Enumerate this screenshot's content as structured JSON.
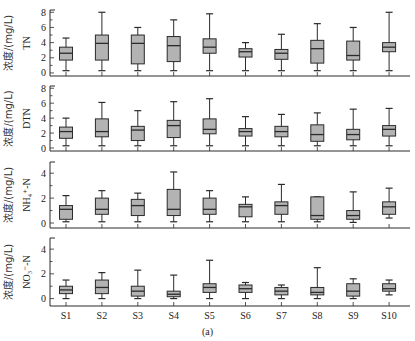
{
  "figure": {
    "caption": "(a)",
    "shared_ylabel_prefix": "浓度/(mg/L)"
  },
  "chart_data": {
    "type": "box",
    "categories": [
      "S1",
      "S2",
      "S3",
      "S4",
      "S5",
      "S6",
      "S7",
      "S8",
      "S9",
      "S10"
    ],
    "xlabel": "",
    "grid": false,
    "legend": null,
    "panels": [
      {
        "ylabel": "浓度/(mg/L) TN",
        "param": "TN",
        "ylim": [
          0,
          8
        ],
        "yticks": [
          0,
          2,
          4,
          6,
          8
        ],
        "boxes": [
          {
            "min": 0.3,
            "q1": 1.7,
            "median": 2.6,
            "q3": 3.4,
            "max": 4.6
          },
          {
            "min": 0.3,
            "q1": 1.7,
            "median": 3.9,
            "q3": 5.0,
            "max": 8.0
          },
          {
            "min": 0.3,
            "q1": 1.2,
            "median": 3.9,
            "q3": 5.0,
            "max": 6.0
          },
          {
            "min": 0.3,
            "q1": 1.5,
            "median": 3.6,
            "q3": 4.8,
            "max": 7.0
          },
          {
            "min": 0.3,
            "q1": 2.6,
            "median": 3.4,
            "q3": 4.5,
            "max": 7.8
          },
          {
            "min": 0.3,
            "q1": 2.1,
            "median": 2.8,
            "q3": 3.2,
            "max": 4.0
          },
          {
            "min": 0.3,
            "q1": 1.8,
            "median": 2.6,
            "q3": 3.1,
            "max": 5.1
          },
          {
            "min": 0.3,
            "q1": 1.3,
            "median": 3.2,
            "q3": 4.3,
            "max": 6.5
          },
          {
            "min": 0.3,
            "q1": 1.7,
            "median": 2.3,
            "q3": 4.2,
            "max": 6.0
          },
          {
            "min": 0.3,
            "q1": 2.8,
            "median": 3.4,
            "q3": 4.0,
            "max": 8.0
          }
        ]
      },
      {
        "ylabel": "浓度/(mg/L) DTN",
        "param": "DTN",
        "ylim": [
          0,
          8
        ],
        "yticks": [
          0,
          2,
          4,
          6,
          8
        ],
        "boxes": [
          {
            "min": 0.3,
            "q1": 1.3,
            "median": 2.2,
            "q3": 2.8,
            "max": 4.0
          },
          {
            "min": 0.3,
            "q1": 1.5,
            "median": 2.2,
            "q3": 3.9,
            "max": 6.1
          },
          {
            "min": 0.3,
            "q1": 1.0,
            "median": 2.4,
            "q3": 2.9,
            "max": 5.0
          },
          {
            "min": 0.3,
            "q1": 1.4,
            "median": 3.0,
            "q3": 3.7,
            "max": 6.2
          },
          {
            "min": 0.3,
            "q1": 1.9,
            "median": 2.5,
            "q3": 3.9,
            "max": 6.6
          },
          {
            "min": 0.3,
            "q1": 1.6,
            "median": 2.2,
            "q3": 2.6,
            "max": 4.2
          },
          {
            "min": 0.3,
            "q1": 1.5,
            "median": 2.2,
            "q3": 2.9,
            "max": 4.5
          },
          {
            "min": 0.3,
            "q1": 0.9,
            "median": 1.8,
            "q3": 3.1,
            "max": 4.7
          },
          {
            "min": 0.3,
            "q1": 1.1,
            "median": 1.8,
            "q3": 2.5,
            "max": 5.2
          },
          {
            "min": 0.3,
            "q1": 1.6,
            "median": 2.5,
            "q3": 3.0,
            "max": 5.3
          }
        ]
      },
      {
        "ylabel": "浓度/(mg/L) NH4+-N",
        "param": "NH₄⁺-N",
        "ylim": [
          0,
          5
        ],
        "yticks": [
          0,
          2,
          4
        ],
        "boxes": [
          {
            "min": 0.1,
            "q1": 0.3,
            "median": 1.1,
            "q3": 1.4,
            "max": 2.2
          },
          {
            "min": 0.1,
            "q1": 0.7,
            "median": 1.1,
            "q3": 2.0,
            "max": 2.6
          },
          {
            "min": 0.1,
            "q1": 0.6,
            "median": 1.4,
            "q3": 1.9,
            "max": 2.4
          },
          {
            "min": 0.1,
            "q1": 0.6,
            "median": 1.1,
            "q3": 2.7,
            "max": 4.1
          },
          {
            "min": 0.1,
            "q1": 0.7,
            "median": 1.1,
            "q3": 2.0,
            "max": 2.6
          },
          {
            "min": 0.1,
            "q1": 0.5,
            "median": 1.3,
            "q3": 1.5,
            "max": 2.1
          },
          {
            "min": 0.1,
            "q1": 0.7,
            "median": 1.4,
            "q3": 1.7,
            "max": 3.1
          },
          {
            "min": 0.1,
            "q1": 0.3,
            "median": 0.6,
            "q3": 2.1,
            "max": 2.1
          },
          {
            "min": 0.05,
            "q1": 0.3,
            "median": 0.6,
            "q3": 1.0,
            "max": 2.5
          },
          {
            "min": 0.4,
            "q1": 0.7,
            "median": 1.3,
            "q3": 1.7,
            "max": 2.8
          }
        ]
      },
      {
        "ylabel": "浓度/(mg/L) NO3--N",
        "param": "NO₃⁻-N",
        "ylim": [
          0,
          5
        ],
        "yticks": [
          0,
          2,
          4
        ],
        "boxes": [
          {
            "min": 0.0,
            "q1": 0.4,
            "median": 0.7,
            "q3": 1.0,
            "max": 1.5
          },
          {
            "min": 0.0,
            "q1": 0.4,
            "median": 0.9,
            "q3": 1.5,
            "max": 2.1
          },
          {
            "min": 0.0,
            "q1": 0.2,
            "median": 0.6,
            "q3": 1.0,
            "max": 2.3
          },
          {
            "min": 0.0,
            "q1": 0.15,
            "median": 0.35,
            "q3": 0.6,
            "max": 1.9
          },
          {
            "min": 0.0,
            "q1": 0.5,
            "median": 0.9,
            "q3": 1.2,
            "max": 3.1
          },
          {
            "min": 0.0,
            "q1": 0.5,
            "median": 0.8,
            "q3": 1.1,
            "max": 1.3
          },
          {
            "min": 0.0,
            "q1": 0.3,
            "median": 0.6,
            "q3": 0.9,
            "max": 1.1
          },
          {
            "min": 0.0,
            "q1": 0.3,
            "median": 0.5,
            "q3": 0.9,
            "max": 2.5
          },
          {
            "min": 0.0,
            "q1": 0.2,
            "median": 0.6,
            "q3": 1.2,
            "max": 1.6
          },
          {
            "min": 0.3,
            "q1": 0.6,
            "median": 0.8,
            "q3": 1.2,
            "max": 1.5
          }
        ]
      }
    ]
  }
}
